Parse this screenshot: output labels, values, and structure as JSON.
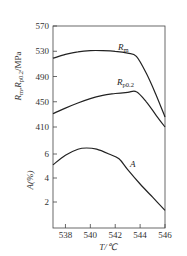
{
  "chart_data": [
    {
      "type": "line",
      "title": "",
      "xlabel": "T/℃",
      "ylabel": "R_m, R_p0.2/MPa",
      "xlim": [
        537,
        546
      ],
      "ylim": [
        410,
        570
      ],
      "x_ticks": [
        538,
        540,
        542,
        544,
        546
      ],
      "y_ticks": [
        410,
        450,
        490,
        530,
        570
      ],
      "grid": false,
      "legend": "inline labels",
      "series": [
        {
          "name": "Rm",
          "x": [
            537,
            538,
            539,
            540,
            541,
            542,
            543,
            543.7,
            544.5,
            545.3,
            546
          ],
          "values": [
            519,
            525,
            529,
            531,
            531,
            530,
            527,
            522,
            495,
            460,
            426
          ]
        },
        {
          "name": "Rp0.2",
          "x": [
            537,
            538,
            539,
            540,
            541,
            542,
            543,
            543.7,
            544.5,
            545.3,
            546
          ],
          "values": [
            431,
            440,
            448,
            455,
            460,
            463,
            465,
            466,
            450,
            428,
            410
          ]
        }
      ]
    },
    {
      "type": "line",
      "title": "",
      "xlabel": "T/℃",
      "ylabel": "A(%)",
      "xlim": [
        537,
        546
      ],
      "ylim": [
        0,
        7
      ],
      "x_ticks": [
        538,
        540,
        542,
        544,
        546
      ],
      "y_ticks": [
        2,
        4,
        6
      ],
      "grid": false,
      "legend": "inline labels",
      "series": [
        {
          "name": "A",
          "x": [
            537,
            538,
            539,
            539.7,
            540.5,
            541.5,
            542.3,
            543,
            544,
            545,
            546
          ],
          "values": [
            5.1,
            5.9,
            6.4,
            6.5,
            6.4,
            6.0,
            5.6,
            4.7,
            3.5,
            2.4,
            1.3
          ]
        }
      ]
    }
  ],
  "labels": {
    "upper_ylabel_main": "R",
    "upper_ylabel_sub1": "m",
    "upper_ylabel_sep": ",",
    "upper_ylabel_sub2": "p0.2",
    "upper_ylabel_unit": "/MPa",
    "lower_ylabel": "A(%)",
    "xlabel": "T/℃",
    "series_rm": "R",
    "series_rm_sub": "m",
    "series_rp": "R",
    "series_rp_sub": "p0.2",
    "series_a": "A"
  }
}
